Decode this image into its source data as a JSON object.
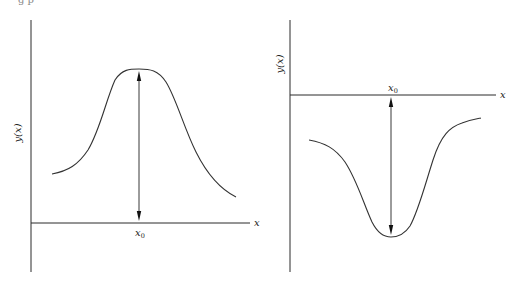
{
  "top_cut_text": "g            p",
  "panels": [
    {
      "name": "maximum",
      "y_label": "y(x)",
      "x_label": "x",
      "x0_label": "x",
      "x0_sub": "0",
      "y_axis": {
        "x": 31,
        "y1": 20,
        "y2": 272
      },
      "x_axis": {
        "y": 223,
        "x1": 31,
        "x2": 250
      },
      "x_label_pos": [
        254,
        226
      ],
      "y_label_pos": [
        21,
        133
      ],
      "x0": 139,
      "x0_label_pos": [
        135,
        236
      ],
      "arrow": {
        "y1": 71,
        "y2": 221
      },
      "curve": "M52,174 C68,171 78,165 88,150 C100,130 106,100 115,80 C122,69 130,69 139,69 C150,69 158,70 166,82 C176,98 184,128 196,152 C208,176 222,190 236,197"
    },
    {
      "name": "minimum",
      "y_label": "y(x)",
      "x_label": "x",
      "x0_label": "x",
      "x0_sub": "0",
      "y_axis": {
        "x": 290,
        "y1": 20,
        "y2": 272
      },
      "x_axis": {
        "y": 95,
        "x1": 290,
        "x2": 496
      },
      "x_label_pos": [
        500,
        98
      ],
      "y_label_pos": [
        283,
        64
      ],
      "x0": 391,
      "x0_label_pos": [
        388,
        91
      ],
      "arrow": {
        "y1": 97,
        "y2": 235
      },
      "curve": "M309,140 C325,143 335,148 345,162 C357,180 364,205 372,222 C378,234 384,237 391,237 C398,237 404,235 410,226 C418,212 425,185 433,160 C441,135 450,127 462,123 C470,120 476,119 481,118"
    }
  ]
}
